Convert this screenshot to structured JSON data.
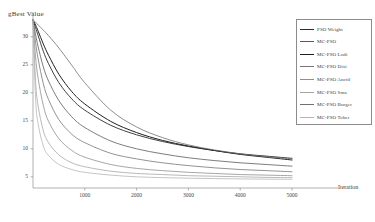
{
  "chart_data": {
    "type": "line",
    "title": "",
    "xlabel": "Iteration",
    "ylabel": "gBest Value",
    "xlim": [
      0,
      5000
    ],
    "ylim": [
      3,
      33
    ],
    "xticks": [
      1000,
      2000,
      3000,
      4000,
      5000
    ],
    "yticks": [
      30,
      25,
      20,
      15,
      10,
      5
    ],
    "grid": false,
    "legend_position": "upper-right",
    "x": [
      0,
      50,
      100,
      200,
      300,
      500,
      750,
      1000,
      1500,
      2000,
      2500,
      3000,
      3500,
      4000,
      4500,
      5000
    ],
    "series": [
      {
        "name": "PSO Weight",
        "color": "#2b2b2b",
        "width": 0.9,
        "values": [
          33,
          31.6,
          30.2,
          27.4,
          25.2,
          21.8,
          18.9,
          16.9,
          14.2,
          12.5,
          11.3,
          10.4,
          9.7,
          9.1,
          8.7,
          8.3
        ]
      },
      {
        "name": "MC-PSO",
        "color": "#5a5a5a",
        "width": 0.8,
        "values": [
          33,
          30.4,
          28.2,
          24.6,
          22.1,
          18.6,
          15.7,
          13.8,
          11.4,
          10.0,
          9.1,
          8.4,
          7.9,
          7.5,
          7.2,
          6.9
        ]
      },
      {
        "name": "MC-PSO Lodi",
        "color": "#1f1f1f",
        "width": 1.0,
        "values": [
          33,
          32.1,
          31.0,
          28.7,
          26.7,
          23.3,
          20.2,
          18.0,
          14.9,
          12.9,
          11.5,
          10.5,
          9.7,
          9.0,
          8.5,
          8.0
        ]
      },
      {
        "name": "MC-PSO Dixi",
        "color": "#767676",
        "width": 0.8,
        "values": [
          33,
          29.0,
          26.0,
          21.6,
          18.8,
          15.2,
          12.6,
          11.1,
          9.2,
          8.2,
          7.5,
          7.0,
          6.6,
          6.3,
          6.1,
          5.9
        ]
      },
      {
        "name": "MC-PSO Anctil",
        "color": "#8f8f8f",
        "width": 0.8,
        "values": [
          33,
          26.4,
          22.5,
          17.7,
          14.9,
          11.8,
          9.7,
          8.5,
          7.2,
          6.5,
          6.1,
          5.8,
          5.6,
          5.4,
          5.3,
          5.2
        ]
      },
      {
        "name": "MC-PSO Sma",
        "color": "#a6a6a6",
        "width": 0.8,
        "values": [
          33,
          22.0,
          17.6,
          13.2,
          11.1,
          8.9,
          7.5,
          6.8,
          6.0,
          5.6,
          5.4,
          5.2,
          5.1,
          5.0,
          4.9,
          4.85
        ]
      },
      {
        "name": "MC-PSO Burger",
        "color": "#707070",
        "width": 0.8,
        "values": [
          33,
          32.6,
          32.1,
          31.2,
          30.2,
          28.0,
          24.9,
          21.8,
          16.9,
          13.9,
          12.0,
          10.7,
          9.8,
          9.1,
          8.6,
          8.2
        ]
      },
      {
        "name": "MC-PSO Tober",
        "color": "#b5b5b5",
        "width": 0.8,
        "values": [
          33,
          19.0,
          14.4,
          10.5,
          8.8,
          7.2,
          6.3,
          5.8,
          5.3,
          5.0,
          4.85,
          4.75,
          4.68,
          4.62,
          4.58,
          4.55
        ]
      }
    ]
  }
}
